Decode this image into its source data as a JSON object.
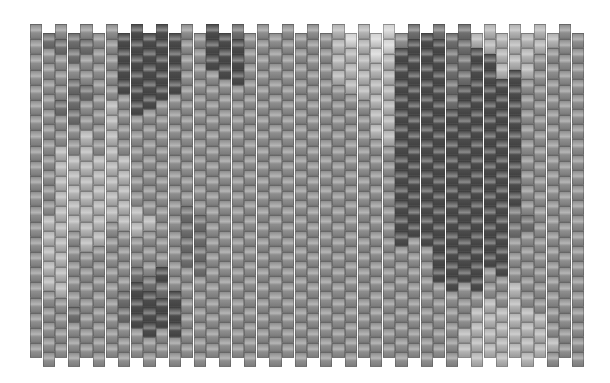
{
  "pattern": {
    "title": "Grayscale camouflage peyote bead pattern",
    "columns": 44,
    "rows": 22,
    "bead_width": 12.6,
    "bead_height": 15.2,
    "offset_odd_columns": 9,
    "palette": [
      "#4c4c4c",
      "#707070",
      "#8e8e8e",
      "#b2b2b2",
      "#d2d2d2"
    ],
    "grid": [
      "2222222222222222222222",
      "1222222222223333322222",
      "2122212233333333332222",
      "1121112233333222221222",
      "2122122333333332222222",
      "2222222233333322222222",
      "2222233333333222222222",
      "0000222233333222211222",
      "0000002222223322100022",
      "0000022222223222100022",
      "0000022222222222010022",
      "0000222222222222200022",
      "2222222222221111222222",
      "2222222222221111222222",
      "0002222222222222222222",
      "0002222222222222222222",
      "1000222222222222222222",
      "2222222222222222222222",
      "2222222222222222222222",
      "2222222222222222222222",
      "2222222222222222222222",
      "2222222222222222222222",
      "2222222222222222222222",
      "2222222222222222222222",
      "3333222222222222222222",
      "4333222222222222222222",
      "3333322222222222222222",
      "4433333222222222222222",
      "4433333322222222222222",
      "2000000000000022222222",
      "1000000000000022222222",
      "0000000000000022222222",
      "1000000000000000022222",
      "1111100000000000022222",
      "1111000000000000022233",
      "3000000000000000023333",
      "3300000000000000223333",
      "3330000000000000223333",
      "3330000000001122233333",
      "3332222222221222223333",
      "3322222222222222222333",
      "3222222222222222222232",
      "2222222222222222222222",
      "2222222222222222222222"
    ]
  }
}
